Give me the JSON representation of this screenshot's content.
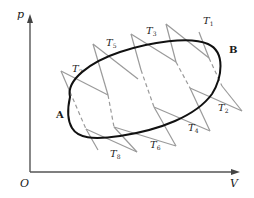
{
  "diagram": {
    "type": "p-V thermodynamic cycle",
    "axes": {
      "y_label": "p",
      "x_label": "V",
      "origin_label": "O"
    },
    "cycle": {
      "shape": "closed ellipse",
      "state_left": "A",
      "state_right": "B"
    },
    "temperature_labels": [
      {
        "id": "T1",
        "base": "T",
        "sub": "1"
      },
      {
        "id": "T2",
        "base": "T",
        "sub": "2"
      },
      {
        "id": "T3",
        "base": "T",
        "sub": "3"
      },
      {
        "id": "T4",
        "base": "T",
        "sub": "4"
      },
      {
        "id": "T5",
        "base": "T",
        "sub": "5"
      },
      {
        "id": "T6",
        "base": "T",
        "sub": "6"
      },
      {
        "id": "T7",
        "base": "T",
        "sub": "7"
      },
      {
        "id": "T8",
        "base": "T",
        "sub": "8"
      }
    ],
    "colors": {
      "axis": "#555555",
      "cycle": "#111111",
      "zigzag": "#9a9a9a",
      "text": "#1a1a1a"
    }
  }
}
